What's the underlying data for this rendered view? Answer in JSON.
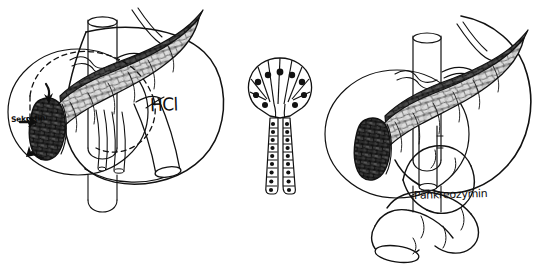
{
  "figure": {
    "background_color": "#ffffff",
    "ink_color": "#111111",
    "width": 555,
    "height": 277
  },
  "panels": {
    "left": {
      "name": "secretin-panel",
      "label": "Sekretin",
      "stimulus_label": "HCl",
      "description": "Pancreas, duodenum and stomach with dashed feedback loop; acid (HCl) in duodenum releases Sekretin which stimulates the pancreas"
    },
    "center": {
      "name": "acinus-panel",
      "description": "Pancreatic acinus with acinar cells and intercalated duct",
      "acinar_cell_count": 9,
      "duct_branches": 2
    },
    "right": {
      "name": "pancreozymin-panel",
      "label": "Pankreozymin",
      "description": "Pancreas with duodenal loops; Pankreozymin (cholecystokinin) released from intestine acts on the pancreas"
    }
  },
  "labels": {
    "sekretin": "Sekretin",
    "hcl": "HCl",
    "pankreozymin": "Pankreozymin"
  },
  "colors": {
    "outline": "#111111",
    "pancreas_light": "#d9d9d9",
    "pancreas_mid": "#9a9a9a",
    "pancreas_dark": "#4a4a4a",
    "pancreas_darkest": "#2b2b2b",
    "nucleus": "#1a1a1a",
    "paper": "#ffffff"
  }
}
